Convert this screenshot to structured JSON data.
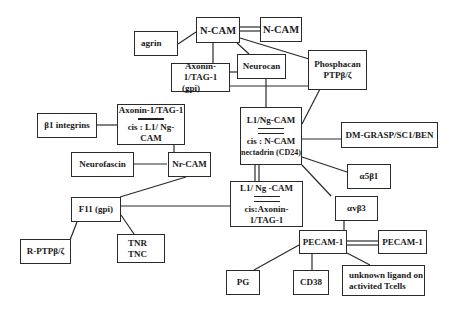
{
  "nodes": {
    "ncam_main": {
      "label": "N-CAM"
    },
    "ncam_right": {
      "label": "N-CAM"
    },
    "agrin": {
      "label": "agrin"
    },
    "axonin_gpi": {
      "line1": "Axonin-1/TAG-1",
      "line2": "(gpi)"
    },
    "neurocan": {
      "label": "Neurocan"
    },
    "phosphacan": {
      "line1": "Phosphacan",
      "line2": "PTPβ/ζ"
    },
    "axonin_cis": {
      "line1": "Axonin-1/TAG-1",
      "line2": "cis : L1/ Ng-CAM"
    },
    "b1_integrins": {
      "label": "β1 integrins"
    },
    "l1_main": {
      "line1": "L1/Ng-CAM",
      "line2": "cis : N-CAM",
      "line3": "nectadrin (CD24)"
    },
    "dm_grasp": {
      "label": "DM-GRASP/SC1/BEN"
    },
    "neurofascin": {
      "label": "Neurofascin"
    },
    "nrcam": {
      "label": "Nr-CAM"
    },
    "a5b1": {
      "label": "α5β1"
    },
    "l1_cis": {
      "line1": "L1/ Ng -CAM",
      "line2": "cis:Axonin-1/TAG-1"
    },
    "f11": {
      "label": "F11 (gpi)"
    },
    "avb3": {
      "label": "αvβ3"
    },
    "rptp": {
      "label": "R-PTPβ/ζ"
    },
    "tnr_tnc": {
      "line1": "TNR",
      "line2": "TNC"
    },
    "pecam_main": {
      "label": "PECAM-1"
    },
    "pecam_right": {
      "label": "PECAM-1"
    },
    "pg": {
      "label": "PG"
    },
    "cd38": {
      "label": "CD38"
    },
    "unknown": {
      "line1": "unknown ligand on",
      "line2": "activited Tcells"
    }
  }
}
